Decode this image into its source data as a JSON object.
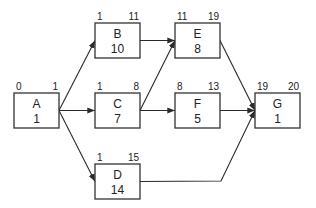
{
  "diagram": {
    "type": "activity-on-node network",
    "nodes": [
      {
        "id": "A",
        "name": "A",
        "duration": "1",
        "start": "0",
        "finish": "1"
      },
      {
        "id": "B",
        "name": "B",
        "duration": "10",
        "start": "1",
        "finish": "11"
      },
      {
        "id": "C",
        "name": "C",
        "duration": "7",
        "start": "1",
        "finish": "8"
      },
      {
        "id": "D",
        "name": "D",
        "duration": "14",
        "start": "1",
        "finish": "15"
      },
      {
        "id": "E",
        "name": "E",
        "duration": "8",
        "start": "11",
        "finish": "19"
      },
      {
        "id": "F",
        "name": "F",
        "duration": "5",
        "start": "8",
        "finish": "13"
      },
      {
        "id": "G",
        "name": "G",
        "duration": "1",
        "start": "19",
        "finish": "20"
      }
    ],
    "edges": [
      {
        "from": "A",
        "to": "B"
      },
      {
        "from": "A",
        "to": "C"
      },
      {
        "from": "A",
        "to": "D"
      },
      {
        "from": "B",
        "to": "E"
      },
      {
        "from": "C",
        "to": "E"
      },
      {
        "from": "C",
        "to": "F"
      },
      {
        "from": "E",
        "to": "G"
      },
      {
        "from": "F",
        "to": "G"
      },
      {
        "from": "D",
        "to": "G"
      }
    ]
  }
}
